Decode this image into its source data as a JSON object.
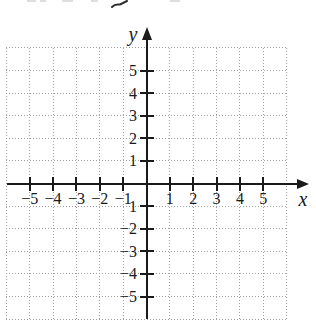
{
  "figure": {
    "kind": "blank cartesian coordinate plane with dotted unit grid",
    "visible_title": ""
  },
  "colors": {
    "axis": "#1a1a1a",
    "grid": "#a0a0a0",
    "label": "#1a1a1a"
  },
  "chart_data": {
    "type": "scatter",
    "title": "",
    "subtitle": "",
    "xlabel": "x",
    "ylabel": "y",
    "xlim": [
      -6,
      6
    ],
    "ylim": [
      -6,
      6
    ],
    "grid": "dotted lines every 1 unit, from -6 to 6 on both axes",
    "legend": "none",
    "series": [],
    "x_ticks": [
      {
        "value": -5,
        "label": "−5"
      },
      {
        "value": -4,
        "label": "−4"
      },
      {
        "value": -3,
        "label": "−3"
      },
      {
        "value": -2,
        "label": "−2"
      },
      {
        "value": -1,
        "label": "−1"
      },
      {
        "value": 1,
        "label": "1"
      },
      {
        "value": 2,
        "label": "2"
      },
      {
        "value": 3,
        "label": "3"
      },
      {
        "value": 4,
        "label": "4"
      },
      {
        "value": 5,
        "label": "5"
      }
    ],
    "y_ticks": [
      {
        "value": 5,
        "label": "5"
      },
      {
        "value": 4,
        "label": "4"
      },
      {
        "value": 3,
        "label": "3"
      },
      {
        "value": 2,
        "label": "2"
      },
      {
        "value": 1,
        "label": "1"
      },
      {
        "value": -1,
        "label": "1"
      },
      {
        "value": -2,
        "label": "−2"
      },
      {
        "value": -3,
        "label": "−3"
      },
      {
        "value": -4,
        "label": "−4"
      },
      {
        "value": -5,
        "label": "−5"
      }
    ]
  }
}
